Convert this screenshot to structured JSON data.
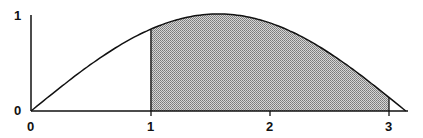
{
  "chart_data": {
    "type": "area",
    "title": "",
    "function": "y = sin(x)",
    "xlabel": "",
    "ylabel": "",
    "xlim": [
      0,
      3.1416
    ],
    "ylim": [
      0,
      1
    ],
    "x_ticks": [
      "0",
      "1",
      "2",
      "3"
    ],
    "y_ticks": [
      "0",
      "1"
    ],
    "grid": false,
    "shaded_region": {
      "x_from": 1,
      "x_to": 3,
      "fill": "dotted gray"
    },
    "series": [
      {
        "name": "sin(x)",
        "x": [
          0,
          0.5,
          1,
          1.5708,
          2,
          2.5,
          3,
          3.1416
        ],
        "values": [
          0,
          0.479,
          0.841,
          1.0,
          0.909,
          0.598,
          0.141,
          0
        ]
      }
    ]
  },
  "labels": {
    "y_top": "1",
    "y_zero": "0",
    "x0": "0",
    "x1": "1",
    "x2": "2",
    "x3": "3"
  },
  "colors": {
    "line": "#111111",
    "shade": "#9a9a9a"
  }
}
